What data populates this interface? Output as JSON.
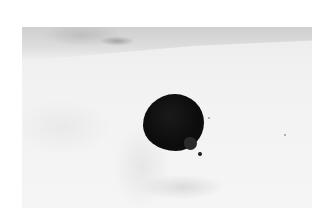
{
  "image": {
    "description": "Black-and-white photograph of a dark balloon floating in a pale, overcast sky",
    "subject": "balloon",
    "colors": {
      "page_background": "#ffffff",
      "sky": "#f3f3f3",
      "cloud_band": "#d0d0d0",
      "balloon": "#0e0e0e"
    }
  }
}
